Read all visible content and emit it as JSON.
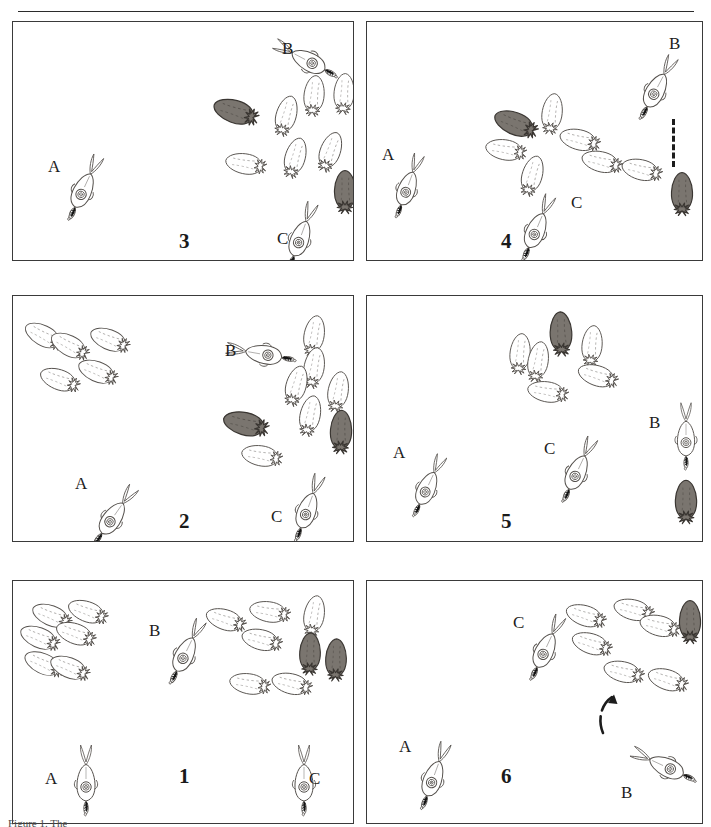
{
  "figure": {
    "type": "scientific-illustration-sequence",
    "rule_above": true,
    "caption_partial": "Figure 1. The",
    "grid": {
      "rows": 3,
      "columns": 2
    },
    "panel_order_reading": [
      "3",
      "4",
      "2",
      "5",
      "1",
      "6"
    ],
    "legend_note": "Labelled individuals A, B and C are tracked across panels; solid-dark animals are chromatically darkened individuals."
  },
  "palette": {
    "ink": "#2b2b2b",
    "panel_border": "#3a3a3a",
    "outline": "#55514d",
    "pale_body": "#ffffff",
    "dark_body": "#7a756f",
    "dark_body_edge": "#3a3632",
    "arm_dark": "#141414",
    "paper": "#ffffff"
  },
  "panels": [
    {
      "id": "panel-3",
      "number": "3",
      "number_pos": {
        "x": 178,
        "y": 228
      },
      "frame": {
        "x": 12,
        "y": 21,
        "w": 340,
        "h": 238
      },
      "labels": [
        {
          "text": "A",
          "x": 47,
          "y": 156
        },
        {
          "text": "B",
          "x": 281,
          "y": 38
        },
        {
          "text": "C",
          "x": 276,
          "y": 228
        }
      ],
      "marked_squid": [
        {
          "name": "A",
          "x": 68,
          "y": 150,
          "rot": 205,
          "scale": 1.0
        },
        {
          "name": "B",
          "x": 290,
          "y": 22,
          "rot": 118,
          "scale": 1.0
        },
        {
          "name": "C",
          "x": 285,
          "y": 198,
          "rot": 200,
          "scale": 1.0
        }
      ],
      "school": [
        {
          "x": 222,
          "y": 88,
          "rot": 108,
          "scale": 1.12,
          "shade": "dark"
        },
        {
          "x": 272,
          "y": 92,
          "rot": 196,
          "scale": 1.0,
          "shade": "pale"
        },
        {
          "x": 300,
          "y": 72,
          "rot": 186,
          "scale": 1.0,
          "shade": "pale"
        },
        {
          "x": 330,
          "y": 70,
          "rot": 184,
          "scale": 1.0,
          "shade": "pale"
        },
        {
          "x": 232,
          "y": 140,
          "rot": 100,
          "scale": 1.0,
          "shade": "pale"
        },
        {
          "x": 281,
          "y": 134,
          "rot": 196,
          "scale": 1.0,
          "shade": "pale"
        },
        {
          "x": 316,
          "y": 128,
          "rot": 200,
          "scale": 1.0,
          "shade": "pale"
        },
        {
          "x": 331,
          "y": 168,
          "rot": 180,
          "scale": 1.05,
          "shade": "dark"
        }
      ]
    },
    {
      "id": "panel-4",
      "number": "4",
      "number_pos": {
        "x": 500,
        "y": 228
      },
      "frame": {
        "x": 366,
        "y": 21,
        "w": 335,
        "h": 238
      },
      "labels": [
        {
          "text": "A",
          "x": 381,
          "y": 144
        },
        {
          "text": "B",
          "x": 668,
          "y": 33
        },
        {
          "text": "C",
          "x": 570,
          "y": 192
        }
      ],
      "marked_squid": [
        {
          "name": "A",
          "x": 392,
          "y": 148,
          "rot": 200,
          "scale": 0.95
        },
        {
          "name": "B",
          "x": 641,
          "y": 50,
          "rot": 208,
          "scale": 1.0
        },
        {
          "name": "C",
          "x": 521,
          "y": 190,
          "rot": 203,
          "scale": 1.0
        }
      ],
      "school": [
        {
          "x": 502,
          "y": 100,
          "rot": 112,
          "scale": 1.1,
          "shade": "dark"
        },
        {
          "x": 538,
          "y": 90,
          "rot": 188,
          "scale": 1.0,
          "shade": "pale"
        },
        {
          "x": 566,
          "y": 116,
          "rot": 104,
          "scale": 1.0,
          "shade": "pale"
        },
        {
          "x": 492,
          "y": 126,
          "rot": 100,
          "scale": 1.0,
          "shade": "pale"
        },
        {
          "x": 588,
          "y": 138,
          "rot": 104,
          "scale": 1.0,
          "shade": "pale"
        },
        {
          "x": 628,
          "y": 146,
          "rot": 104,
          "scale": 1.0,
          "shade": "pale"
        },
        {
          "x": 518,
          "y": 152,
          "rot": 196,
          "scale": 1.0,
          "shade": "pale"
        },
        {
          "x": 668,
          "y": 170,
          "rot": 180,
          "scale": 1.05,
          "shade": "dark"
        }
      ],
      "strike_line": {
        "x": 671,
        "y": 118,
        "h": 48,
        "style": "dashed"
      }
    },
    {
      "id": "panel-2",
      "number": "2",
      "number_pos": {
        "x": 178,
        "y": 508
      },
      "frame": {
        "x": 12,
        "y": 295,
        "w": 340,
        "h": 245
      },
      "labels": [
        {
          "text": "A",
          "x": 74,
          "y": 473
        },
        {
          "text": "B",
          "x": 224,
          "y": 340
        },
        {
          "text": "C",
          "x": 270,
          "y": 506
        }
      ],
      "marked_squid": [
        {
          "name": "A",
          "x": 98,
          "y": 478,
          "rot": 215,
          "scale": 1.0
        },
        {
          "name": "B",
          "x": 245,
          "y": 316,
          "rot": 100,
          "scale": 1.0
        },
        {
          "name": "C",
          "x": 292,
          "y": 470,
          "rot": 200,
          "scale": 1.0
        }
      ],
      "school": [
        {
          "x": 30,
          "y": 312,
          "rot": 118,
          "scale": 1.0,
          "shade": "pale"
        },
        {
          "x": 56,
          "y": 322,
          "rot": 118,
          "scale": 1.0,
          "shade": "pale"
        },
        {
          "x": 96,
          "y": 316,
          "rot": 112,
          "scale": 1.0,
          "shade": "pale"
        },
        {
          "x": 46,
          "y": 356,
          "rot": 110,
          "scale": 1.0,
          "shade": "pale"
        },
        {
          "x": 84,
          "y": 348,
          "rot": 112,
          "scale": 1.0,
          "shade": "pale"
        },
        {
          "x": 300,
          "y": 312,
          "rot": 190,
          "scale": 1.0,
          "shade": "pale"
        },
        {
          "x": 300,
          "y": 344,
          "rot": 190,
          "scale": 1.0,
          "shade": "pale"
        },
        {
          "x": 282,
          "y": 362,
          "rot": 196,
          "scale": 1.0,
          "shade": "pale"
        },
        {
          "x": 324,
          "y": 368,
          "rot": 190,
          "scale": 1.0,
          "shade": "pale"
        },
        {
          "x": 296,
          "y": 392,
          "rot": 192,
          "scale": 1.0,
          "shade": "pale"
        },
        {
          "x": 232,
          "y": 400,
          "rot": 104,
          "scale": 1.12,
          "shade": "dark"
        },
        {
          "x": 248,
          "y": 432,
          "rot": 100,
          "scale": 1.0,
          "shade": "pale"
        },
        {
          "x": 327,
          "y": 408,
          "rot": 182,
          "scale": 1.06,
          "shade": "dark"
        }
      ]
    },
    {
      "id": "panel-5",
      "number": "5",
      "number_pos": {
        "x": 500,
        "y": 508
      },
      "frame": {
        "x": 366,
        "y": 295,
        "w": 335,
        "h": 245
      },
      "labels": [
        {
          "text": "A",
          "x": 392,
          "y": 442
        },
        {
          "text": "B",
          "x": 648,
          "y": 412
        },
        {
          "text": "C",
          "x": 543,
          "y": 438
        }
      ],
      "marked_squid": [
        {
          "name": "A",
          "x": 412,
          "y": 448,
          "rot": 205,
          "scale": 0.95
        },
        {
          "name": "B",
          "x": 670,
          "y": 398,
          "rot": 180,
          "scale": 0.95
        },
        {
          "name": "C",
          "x": 562,
          "y": 432,
          "rot": 205,
          "scale": 1.0
        }
      ],
      "school": [
        {
          "x": 547,
          "y": 310,
          "rot": 178,
          "scale": 1.08,
          "shade": "dark"
        },
        {
          "x": 506,
          "y": 330,
          "rot": 186,
          "scale": 1.0,
          "shade": "pale"
        },
        {
          "x": 524,
          "y": 338,
          "rot": 190,
          "scale": 1.0,
          "shade": "pale"
        },
        {
          "x": 578,
          "y": 322,
          "rot": 186,
          "scale": 1.0,
          "shade": "pale"
        },
        {
          "x": 584,
          "y": 352,
          "rot": 108,
          "scale": 1.0,
          "shade": "pale"
        },
        {
          "x": 534,
          "y": 368,
          "rot": 100,
          "scale": 1.0,
          "shade": "pale"
        },
        {
          "x": 672,
          "y": 478,
          "rot": 180,
          "scale": 1.06,
          "shade": "dark"
        }
      ]
    },
    {
      "id": "panel-1",
      "number": "1",
      "number_pos": {
        "x": 178,
        "y": 763
      },
      "frame": {
        "x": 12,
        "y": 580,
        "w": 340,
        "h": 242
      },
      "labels": [
        {
          "text": "A",
          "x": 44,
          "y": 768
        },
        {
          "text": "B",
          "x": 148,
          "y": 620
        },
        {
          "text": "C",
          "x": 308,
          "y": 768
        }
      ],
      "marked_squid": [
        {
          "name": "A",
          "x": 70,
          "y": 742,
          "rot": 180,
          "scale": 1.0
        },
        {
          "name": "B",
          "x": 170,
          "y": 614,
          "rot": 206,
          "scale": 1.0
        },
        {
          "name": "C",
          "x": 288,
          "y": 742,
          "rot": 180,
          "scale": 1.0
        }
      ],
      "school": [
        {
          "x": 38,
          "y": 592,
          "rot": 112,
          "scale": 1.0,
          "shade": "pale"
        },
        {
          "x": 74,
          "y": 588,
          "rot": 110,
          "scale": 1.0,
          "shade": "pale"
        },
        {
          "x": 26,
          "y": 614,
          "rot": 112,
          "scale": 1.0,
          "shade": "pale"
        },
        {
          "x": 62,
          "y": 610,
          "rot": 110,
          "scale": 1.0,
          "shade": "pale"
        },
        {
          "x": 30,
          "y": 640,
          "rot": 114,
          "scale": 1.0,
          "shade": "pale"
        },
        {
          "x": 56,
          "y": 644,
          "rot": 112,
          "scale": 1.0,
          "shade": "pale"
        },
        {
          "x": 212,
          "y": 596,
          "rot": 108,
          "scale": 1.0,
          "shade": "pale"
        },
        {
          "x": 256,
          "y": 588,
          "rot": 100,
          "scale": 1.0,
          "shade": "pale"
        },
        {
          "x": 300,
          "y": 592,
          "rot": 190,
          "scale": 1.0,
          "shade": "pale"
        },
        {
          "x": 248,
          "y": 616,
          "rot": 104,
          "scale": 1.0,
          "shade": "pale"
        },
        {
          "x": 296,
          "y": 630,
          "rot": 182,
          "scale": 1.03,
          "shade": "dark"
        },
        {
          "x": 322,
          "y": 636,
          "rot": 182,
          "scale": 1.03,
          "shade": "dark"
        },
        {
          "x": 236,
          "y": 660,
          "rot": 100,
          "scale": 1.0,
          "shade": "pale"
        },
        {
          "x": 278,
          "y": 660,
          "rot": 104,
          "scale": 1.0,
          "shade": "pale"
        }
      ]
    },
    {
      "id": "panel-6",
      "number": "6",
      "number_pos": {
        "x": 500,
        "y": 763
      },
      "frame": {
        "x": 366,
        "y": 580,
        "w": 335,
        "h": 242
      },
      "labels": [
        {
          "text": "A",
          "x": 398,
          "y": 736
        },
        {
          "text": "B",
          "x": 620,
          "y": 782
        },
        {
          "text": "C",
          "x": 512,
          "y": 612
        }
      ],
      "marked_squid": [
        {
          "name": "A",
          "x": 418,
          "y": 738,
          "rot": 200,
          "scale": 1.0
        },
        {
          "name": "B",
          "x": 648,
          "y": 728,
          "rot": 115,
          "scale": 1.0
        },
        {
          "name": "C",
          "x": 530,
          "y": 610,
          "rot": 205,
          "scale": 1.0
        }
      ],
      "school": [
        {
          "x": 572,
          "y": 592,
          "rot": 108,
          "scale": 1.0,
          "shade": "pale"
        },
        {
          "x": 620,
          "y": 586,
          "rot": 104,
          "scale": 1.0,
          "shade": "pale"
        },
        {
          "x": 646,
          "y": 602,
          "rot": 104,
          "scale": 1.0,
          "shade": "pale"
        },
        {
          "x": 578,
          "y": 620,
          "rot": 108,
          "scale": 1.0,
          "shade": "pale"
        },
        {
          "x": 676,
          "y": 598,
          "rot": 180,
          "scale": 1.05,
          "shade": "dark"
        },
        {
          "x": 610,
          "y": 648,
          "rot": 104,
          "scale": 1.0,
          "shade": "pale"
        },
        {
          "x": 654,
          "y": 656,
          "rot": 108,
          "scale": 1.0,
          "shade": "pale"
        }
      ],
      "rotation_arrow": {
        "x": 596,
        "y": 688,
        "w": 48,
        "h": 52,
        "direction": "counter-clockwise"
      }
    }
  ]
}
